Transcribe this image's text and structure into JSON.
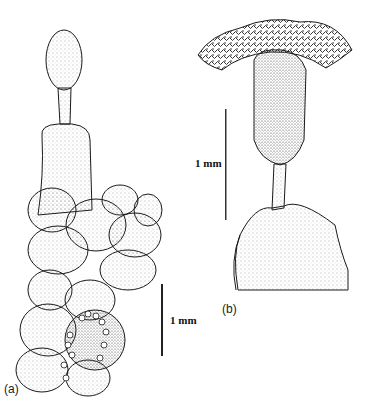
{
  "figure": {
    "panels": [
      {
        "label": "(a)",
        "scale_label": "1 mm"
      },
      {
        "label": "(b)",
        "scale_label": "1 mm"
      }
    ],
    "colors": {
      "ink": "#1a1a1a",
      "stipple": "#555555",
      "background": "#ffffff"
    }
  }
}
